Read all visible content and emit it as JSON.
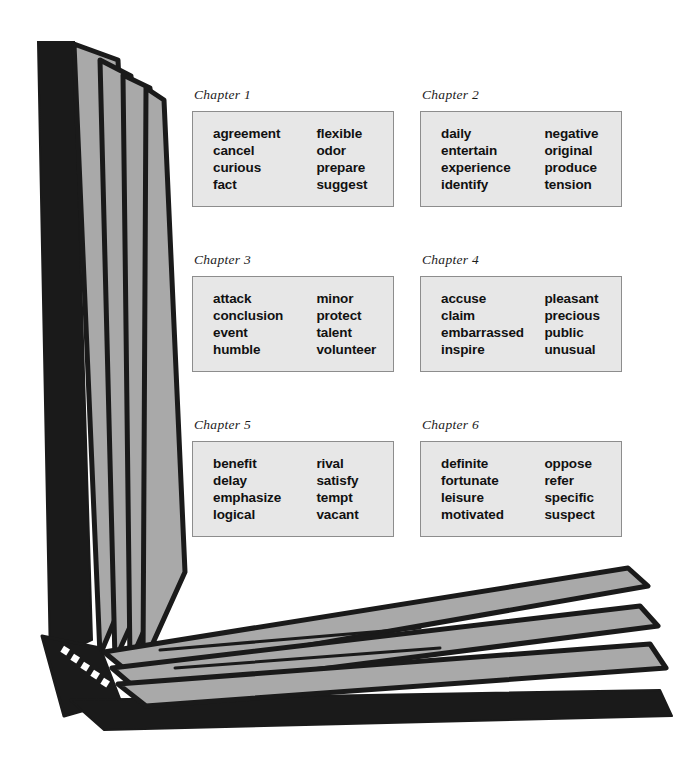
{
  "illustration": {
    "name": "open-book-diagram",
    "description": "Open book with fanned pages forming an L-shaped frame around the chapter word lists",
    "colors": {
      "page_fill": "#a9a9a9",
      "outline": "#1a1a1a",
      "spine_dark": "#1a1a1a",
      "background": "#ffffff"
    }
  },
  "chapters": [
    {
      "label": "Chapter 1",
      "left_column": [
        "agreement",
        "cancel",
        "curious",
        "fact"
      ],
      "right_column": [
        "flexible",
        "odor",
        "prepare",
        "suggest"
      ]
    },
    {
      "label": "Chapter 2",
      "left_column": [
        "daily",
        "entertain",
        "experience",
        "identify"
      ],
      "right_column": [
        "negative",
        "original",
        "produce",
        "tension"
      ]
    },
    {
      "label": "Chapter 3",
      "left_column": [
        "attack",
        "conclusion",
        "event",
        "humble"
      ],
      "right_column": [
        "minor",
        "protect",
        "talent",
        "volunteer"
      ]
    },
    {
      "label": "Chapter 4",
      "left_column": [
        "accuse",
        "claim",
        "embarrassed",
        "inspire"
      ],
      "right_column": [
        "pleasant",
        "precious",
        "public",
        "unusual"
      ]
    },
    {
      "label": "Chapter 5",
      "left_column": [
        "benefit",
        "delay",
        "emphasize",
        "logical"
      ],
      "right_column": [
        "rival",
        "satisfy",
        "tempt",
        "vacant"
      ]
    },
    {
      "label": "Chapter 6",
      "left_column": [
        "definite",
        "fortunate",
        "leisure",
        "motivated"
      ],
      "right_column": [
        "oppose",
        "refer",
        "specific",
        "suspect"
      ]
    }
  ]
}
